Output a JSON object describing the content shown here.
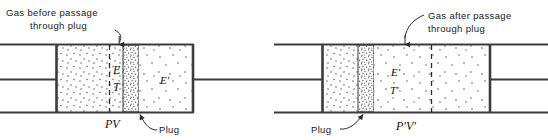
{
  "figure": {
    "background_color": "#ffffff",
    "line_color": "#3c3c3c",
    "text_color": "#1a1a1a",
    "panels": [
      {
        "id": "before",
        "callout": {
          "line1": "Gas before passage",
          "line2": "through plug"
        },
        "labels": {
          "energy": "E",
          "temperature": "T",
          "work": "PV",
          "downstream_energy": "E'",
          "plug": "Plug"
        }
      },
      {
        "id": "after",
        "callout": {
          "line1": "Gas after passage",
          "line2": "through plug"
        },
        "labels": {
          "energy": "E'",
          "temperature": "T'",
          "work": "P'V'",
          "plug": "Plug"
        }
      }
    ]
  }
}
